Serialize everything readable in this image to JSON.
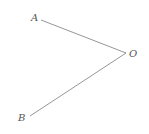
{
  "diagram": {
    "type": "angle",
    "vertex": {
      "label": "O",
      "x": 126,
      "y": 53
    },
    "points": [
      {
        "label": "A",
        "x": 41,
        "y": 20
      },
      {
        "label": "B",
        "x": 30,
        "y": 116
      }
    ],
    "rays": [
      {
        "from": "O",
        "to": "A"
      },
      {
        "from": "O",
        "to": "B"
      }
    ],
    "colors": {
      "line": "#8a8a8a",
      "label": "#555555",
      "background": "#ffffff"
    }
  }
}
